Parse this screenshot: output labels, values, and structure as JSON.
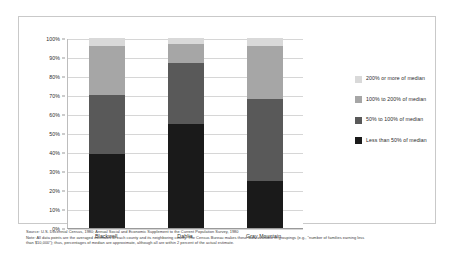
{
  "chart_data": {
    "type": "bar",
    "subtype": "stacked-percentage-column",
    "title": "",
    "subtitle": "",
    "xlabel": "",
    "ylabel": "",
    "categories": [
      "Blackwell",
      "Dahlia",
      "Gray Mountain"
    ],
    "series": [
      {
        "name": "Less than 50% of median",
        "color": "#1a1a1a",
        "values": [
          39,
          55,
          25
        ]
      },
      {
        "name": "50% to 100% of median",
        "color": "#595959",
        "values": [
          31,
          32,
          43
        ]
      },
      {
        "name": "100% to 200% of median",
        "color": "#a6a6a6",
        "values": [
          26,
          10,
          28
        ]
      },
      {
        "name": "200% or more of median",
        "color": "#d9d9d9",
        "values": [
          4,
          3,
          4
        ]
      }
    ],
    "ylim": [
      0,
      100
    ],
    "yticks": [
      "0%",
      "10%",
      "20%",
      "30%",
      "40%",
      "50%",
      "60%",
      "70%",
      "80%",
      "90%",
      "100%"
    ],
    "ytick_values": [
      0,
      10,
      20,
      30,
      40,
      50,
      60,
      70,
      80,
      90,
      100
    ],
    "grid": true,
    "legend_position": "right",
    "legend_order_top_to_bottom": [
      "200% or more of median",
      "100% to 200% of median",
      "50% to 100% of median",
      "Less than 50% of median"
    ]
  },
  "legend": {
    "items": [
      {
        "label": "200% or more of median",
        "color": "#d9d9d9"
      },
      {
        "label": "100% to 200% of median",
        "color": "#a6a6a6"
      },
      {
        "label": "50% to 100% of median",
        "color": "#595959"
      },
      {
        "label": "Less than 50% of median",
        "color": "#1a1a1a"
      }
    ]
  },
  "footnote": {
    "line1": "Source: U.S. Decennial Census, 1980; Annual Social and Economic Supplement to the Current Population Survey, 1980",
    "line2": "Note: All data points are the averaged estimates of each county and its neighboring county. The Census Bureau makes these data available in groupings (e.g., \"number of families earning less",
    "line3": "than $10,000\"); thus, percentages of median are approximate, although all are within 2 percent of the actual estimate."
  },
  "colors": {
    "background": "#ffffff",
    "frame_border": "#c9c9c9",
    "gridline": "#d6d6d6",
    "axis_line": "#9a9a9a",
    "text": "#2b2b2b"
  }
}
